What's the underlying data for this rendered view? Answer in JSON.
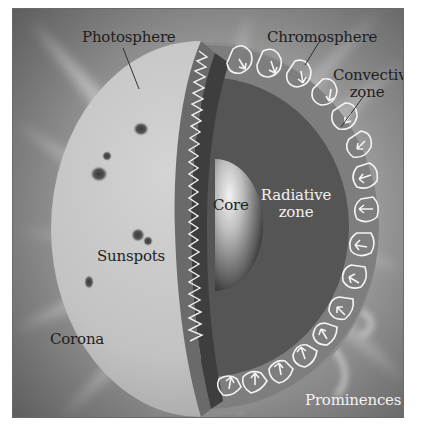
{
  "diagram": {
    "labels": {
      "photosphere": "Photosphere",
      "chromosphere": "Chromosphere",
      "convective_zone_line1": "Convective",
      "convective_zone_line2": "zone",
      "core": "Core",
      "radiative_zone_line1": "Radiative",
      "radiative_zone_line2": "zone",
      "sunspots": "Sunspots",
      "corona": "Corona",
      "prominences": "Prominences"
    },
    "colors": {
      "background_corona": "#8a8a8a",
      "photosphere": "#c4c4c4",
      "convective_zone": "#808080",
      "radiative_zone": "#5a5a5a",
      "core": "#b0b0b0",
      "convection_lines": "#f4f4f4",
      "sunspot": "#4a4a4a"
    }
  }
}
